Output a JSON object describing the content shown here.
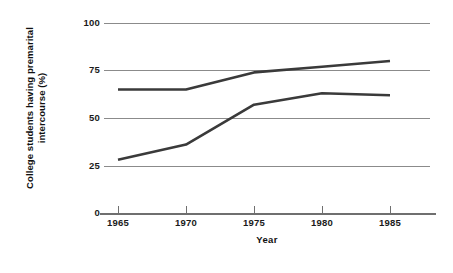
{
  "chart_data": {
    "type": "line",
    "title": "",
    "xlabel": "Year",
    "ylabel": "College students having premarital intercourse (%)",
    "x": [
      1965,
      1970,
      1975,
      1980,
      1985
    ],
    "xtick_labels": [
      "1965",
      "1970",
      "1975",
      "1980",
      "1985"
    ],
    "ytick_labels": [
      "0",
      "25",
      "50",
      "75",
      "100"
    ],
    "yticks": [
      0,
      25,
      50,
      75,
      100
    ],
    "ylim": [
      0,
      100
    ],
    "xlim": [
      1963,
      1987
    ],
    "grid": "horizontal",
    "legend": "none",
    "series": [
      {
        "name": "upper-series",
        "color": "#3a3a3a",
        "values": [
          65,
          65,
          74,
          77,
          80
        ]
      },
      {
        "name": "lower-series",
        "color": "#3a3a3a",
        "values": [
          28,
          36,
          57,
          63,
          62
        ]
      }
    ]
  },
  "axes": {
    "x_title": "Year",
    "y_title_line1": "College students having premarital",
    "y_title_line2": "intercourse (%)",
    "y_labels": {
      "t100": "100",
      "t75": "75",
      "t50": "50",
      "t25": "25",
      "t0": "0"
    },
    "x_labels": {
      "x1": "1965",
      "x2": "1970",
      "x3": "1975",
      "x4": "1980",
      "x5": "1985"
    }
  },
  "colors": {
    "line": "#3a3a3a",
    "gridline": "#8b8b8b",
    "axis": "#6f6f6f",
    "text": "#111111",
    "background": "#ffffff"
  }
}
